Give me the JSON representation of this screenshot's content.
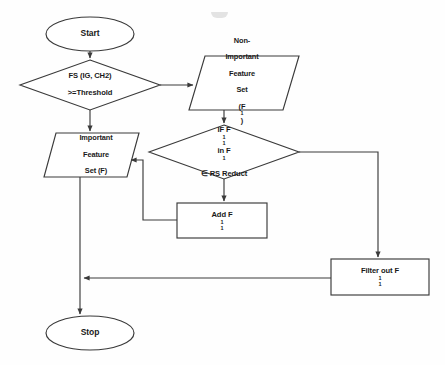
{
  "diagram": {
    "type": "flowchart",
    "stroke_color": "#3a3a3a",
    "text_color": "#1a1a1a",
    "background_color": "#fefefe"
  },
  "nodes": {
    "start": {
      "label": "Start",
      "shape": "terminator"
    },
    "decision_threshold": {
      "line1": "FS (IG, CH2)",
      "line2": ">=Threshold",
      "shape": "decision"
    },
    "non_important_set": {
      "line1": "Non-",
      "line2": "Important",
      "line3": "Feature",
      "line4": "Set",
      "line5": "(F",
      "line5_sup": "1",
      "line5_end": ")",
      "shape": "data-parallelogram"
    },
    "important_set": {
      "line1": "Important",
      "line2": "Feature",
      "line3": "Set (F)",
      "shape": "data-parallelogram"
    },
    "decision_reduct": {
      "line1_a": "IF F",
      "line1_sub": "1",
      "line1_sup": "1",
      "line1_b": " in F",
      "line1_sup2": "1",
      "line2": "∈ RS Reduct",
      "shape": "decision"
    },
    "add_feature": {
      "text_a": "Add F",
      "sub": "1",
      "sup": "1",
      "shape": "process"
    },
    "filter_feature": {
      "text_a": "Filter out F",
      "sub": "1",
      "sup": "1",
      "shape": "process"
    },
    "stop": {
      "label": "Stop",
      "shape": "terminator"
    }
  },
  "edges": [
    {
      "name": "start-to-decision-threshold",
      "from": "start",
      "to": "decision_threshold"
    },
    {
      "name": "decision-threshold-to-non-important",
      "from": "decision_threshold",
      "to": "non_important_set"
    },
    {
      "name": "decision-threshold-to-important",
      "from": "decision_threshold",
      "to": "important_set"
    },
    {
      "name": "non-important-to-decision-reduct",
      "from": "non_important_set",
      "to": "decision_reduct"
    },
    {
      "name": "decision-reduct-to-add",
      "from": "decision_reduct",
      "to": "add_feature"
    },
    {
      "name": "decision-reduct-to-filter",
      "from": "decision_reduct",
      "to": "filter_feature"
    },
    {
      "name": "add-to-important",
      "from": "add_feature",
      "to": "important_set"
    },
    {
      "name": "filter-to-stop-path",
      "from": "filter_feature",
      "to": "stop"
    },
    {
      "name": "important-to-stop",
      "from": "important_set",
      "to": "stop"
    }
  ]
}
